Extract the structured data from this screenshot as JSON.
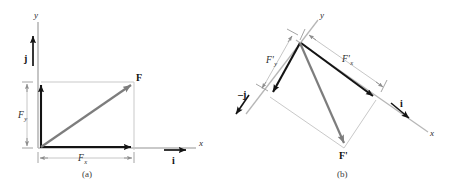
{
  "figure": {
    "type": "vector-decomposition-diagram",
    "panels": [
      {
        "id": "a",
        "caption": "(a)",
        "axis_labels": {
          "x": "x",
          "y": "y"
        },
        "unit_vectors": [
          {
            "name": "j-unit-vector",
            "label": "j",
            "direction": "up"
          },
          {
            "name": "i-unit-vector",
            "label": "i",
            "direction": "right"
          }
        ],
        "vectors": [
          {
            "name": "resultant",
            "label": "F",
            "style": "bold-italic"
          }
        ],
        "components": [
          {
            "name": "x-component",
            "base": "F",
            "sub": "x"
          },
          {
            "name": "y-component",
            "base": "F",
            "sub": "y"
          }
        ]
      },
      {
        "id": "b",
        "caption": "(b)",
        "axis_labels": {
          "x": "x",
          "y": "y"
        },
        "unit_vectors": [
          {
            "name": "minus-j-unit-vector",
            "label": "−j",
            "direction": "down-left"
          },
          {
            "name": "i-unit-vector",
            "label": "i",
            "direction": "down-right"
          }
        ],
        "vectors": [
          {
            "name": "resultant",
            "label": "F'",
            "style": "bold-italic"
          }
        ],
        "components": [
          {
            "name": "x-component",
            "base": "F'",
            "sub": "x"
          },
          {
            "name": "y-component",
            "base": "F'",
            "sub": "y"
          }
        ]
      }
    ],
    "colors": {
      "axis": "#b7b7b7",
      "guide": "#c9c9c9",
      "component_arrow": "#1a1a1a",
      "resultant_arrow": "#7a7a7a",
      "text": "#2b2b2b",
      "background": "#ffffff"
    },
    "glyphs": {
      "F": "F",
      "F_prime": "F'",
      "sub_x": "x",
      "sub_y": "y",
      "i": "i",
      "j": "j",
      "minus_j": "–j",
      "x_axis": "x",
      "y_axis": "y"
    }
  }
}
